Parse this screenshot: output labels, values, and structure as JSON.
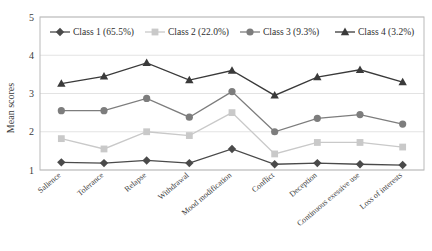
{
  "chart_data": {
    "type": "line",
    "title": "",
    "xlabel": "",
    "ylabel": "Mean scores",
    "ylim": [
      1,
      5
    ],
    "yticks": [
      1,
      2,
      3,
      4,
      5
    ],
    "grid": true,
    "legend_position": "top-inside",
    "categories": [
      "Salience",
      "Tolerance",
      "Relapse",
      "Withdrawal",
      "Mood modification",
      "Conflict",
      "Deception",
      "Continuous exessive use",
      "Loss of interests"
    ],
    "series": [
      {
        "name": "Class 1 (65.5%)",
        "legend_label": "Class 1 (65.5%)",
        "marker": "diamond",
        "color": "#4a4a4a",
        "values": [
          1.2,
          1.18,
          1.25,
          1.18,
          1.55,
          1.15,
          1.18,
          1.15,
          1.13
        ]
      },
      {
        "name": "Class 2 (22.0%)",
        "legend_label": "Class 2 (22.0%)",
        "marker": "square",
        "color": "#c9c9c9",
        "values": [
          1.82,
          1.55,
          2.0,
          1.9,
          2.5,
          1.42,
          1.72,
          1.72,
          1.6
        ]
      },
      {
        "name": "Class 3 (9.3%)",
        "legend_label": "Class 3 (9.3%)",
        "marker": "circle",
        "color": "#7d7d7d",
        "values": [
          2.55,
          2.55,
          2.87,
          2.38,
          3.05,
          2.0,
          2.35,
          2.45,
          2.2
        ]
      },
      {
        "name": "Class 4 (3.2%)",
        "legend_label": "Class 4 (3.2%)",
        "marker": "triangle",
        "color": "#3a3a3a",
        "values": [
          3.26,
          3.45,
          3.8,
          3.35,
          3.6,
          2.95,
          3.43,
          3.62,
          3.3
        ]
      }
    ]
  }
}
